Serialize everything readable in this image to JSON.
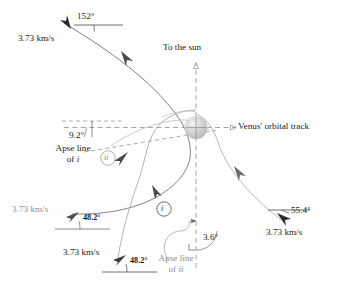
{
  "figure": {
    "type": "orbital-flyby-diagram",
    "colors": {
      "ink": "#1a1a1a",
      "gray": "#8d8d8d",
      "curve_dark": "#6e6e6e",
      "curve_light": "#b4b4b4",
      "planet": "#c9c9c9",
      "dashed": "#9a9a9a"
    }
  },
  "labels": {
    "incoming_speed": "3.73 km/s",
    "incoming_angle": "152°",
    "to_the_sun": "To the sun",
    "venus_track": "Venus' orbital track",
    "angle_9_2": "9.2°",
    "apse_line_of_i_line1": "Apse line",
    "apse_line_of_i_line2": "of i",
    "marker_ii": "ii",
    "marker_i": "i",
    "outgoing_ii_speed": "3.73 km/s",
    "outgoing_ii_angle": "48.2°",
    "outgoing_i_speed": "3.73 km/s",
    "outgoing_i_angle": "48.2°",
    "apse_line_of_ii_line1": "Apse line",
    "apse_line_of_ii_line2": "of ii",
    "angle_3_6": "3.6°",
    "outgoing_right_angle": "55.4°",
    "outgoing_right_speed": "3.73 km/s"
  },
  "icons": {
    "arrowhead": "arrowhead-icon",
    "open_arrowhead": "open-arrowhead-icon",
    "planet_sphere": "venus-sphere-icon",
    "right_angle_mark": "right-angle-mark-icon"
  }
}
